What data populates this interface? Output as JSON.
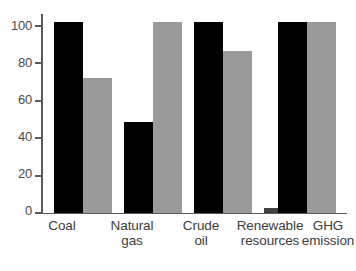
{
  "chart_data": {
    "type": "bar",
    "title": "",
    "subtitle": "",
    "xlabel": "",
    "ylabel": "",
    "ylim": [
      0,
      110
    ],
    "yticks": [
      0,
      20,
      40,
      60,
      80,
      100
    ],
    "ytick_labels": [
      "0",
      "20",
      "40",
      "60",
      "80",
      "100"
    ],
    "grid": false,
    "legend": "none",
    "categories": [
      "Coal",
      "Natural gas",
      "Crude oil",
      "Renewable resources",
      "GHG emission"
    ],
    "category_lines": [
      [
        "Coal"
      ],
      [
        "Natural",
        "gas"
      ],
      [
        "Crude",
        "oil"
      ],
      [
        "Renewable",
        "resources"
      ],
      [
        "GHG",
        "emission"
      ]
    ],
    "series": [
      {
        "name": "series-1",
        "color": "#000000",
        "values": [
          105,
          50,
          105,
          3,
          105
        ]
      },
      {
        "name": "series-2",
        "color": "#9a9a9a",
        "values": [
          74,
          105,
          89,
          9,
          105
        ]
      }
    ],
    "bar_styles": [
      [
        "black",
        "gray"
      ],
      [
        "black",
        "gray"
      ],
      [
        "black",
        "gray"
      ],
      [
        "darkgray",
        "white"
      ],
      [
        "black",
        "gray"
      ]
    ],
    "colors": {
      "series_1": "#000000",
      "series_2": "#9a9a9a",
      "renewable_series_1": "#404040",
      "renewable_series_2": "#ffffff",
      "renewable_series_2_border": "#8a8a8a",
      "axis": "#5a5a5a",
      "text": "#3c3c3c",
      "background": "#ffffff"
    }
  },
  "axis": {
    "y": {
      "labels": [
        "100",
        "80",
        "60",
        "40",
        "20",
        "0"
      ]
    }
  }
}
